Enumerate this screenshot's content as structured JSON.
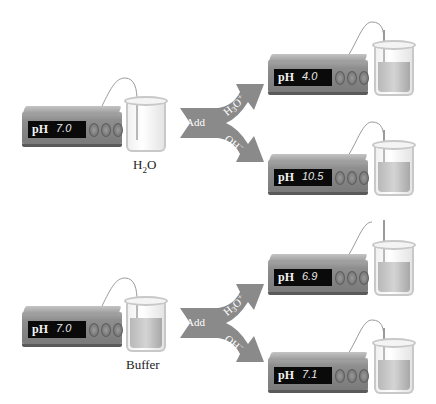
{
  "setups": [
    {
      "id": "water",
      "ph": "7.0",
      "caption": "H2O",
      "liquid_pct": 0
    },
    {
      "id": "water-acid",
      "ph": "4.0",
      "liquid_pct": 60
    },
    {
      "id": "water-base",
      "ph": "10.5",
      "liquid_pct": 60
    },
    {
      "id": "buffer",
      "ph": "7.0",
      "caption": "Buffer",
      "liquid_pct": 60
    },
    {
      "id": "buffer-acid",
      "ph": "6.9",
      "liquid_pct": 60
    },
    {
      "id": "buffer-base",
      "ph": "7.1",
      "liquid_pct": 60
    }
  ],
  "arrows": [
    {
      "add": "Add",
      "top": "H3O+",
      "bottom": "OH−"
    },
    {
      "add": "Add",
      "top": "H3O+",
      "bottom": "OH−"
    }
  ],
  "meter_label": "pH",
  "colors": {
    "arrow": "#8a8a8a",
    "display": "#0a0a0a",
    "meter": "#8e8e8e"
  }
}
